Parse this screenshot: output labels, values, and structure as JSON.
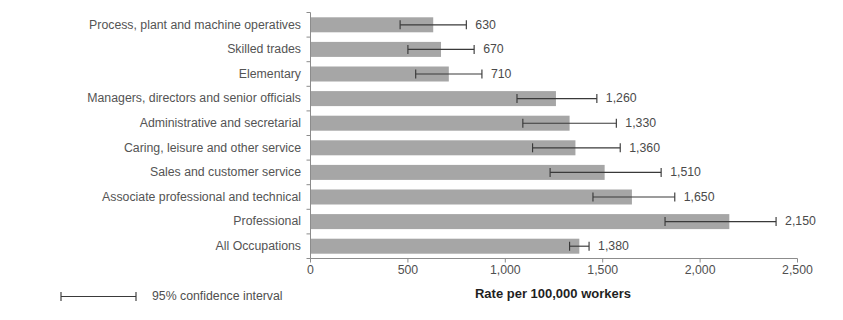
{
  "chart_data": {
    "type": "bar",
    "orientation": "horizontal",
    "title": "",
    "xlabel": "Rate per 100,000 workers",
    "ylabel": "",
    "xlim": [
      0,
      2500
    ],
    "xticks": [
      0,
      500,
      1000,
      1500,
      2000,
      2500
    ],
    "xtick_labels": [
      "0",
      "500",
      "1,000",
      "1,500",
      "2,000",
      "2,500"
    ],
    "grid": false,
    "legend": {
      "position": "bottom-left",
      "entries": [
        {
          "label": "95% confidence interval",
          "marker": "errorbar-capped-line"
        }
      ]
    },
    "categories": [
      "Process, plant and machine operatives",
      "Skilled trades",
      "Elementary",
      "Managers, directors and senior officials",
      "Administrative and secretarial",
      "Caring, leisure and other service",
      "Sales and customer service",
      "Associate professional and technical",
      "Professional",
      "All Occupations"
    ],
    "values": [
      630,
      670,
      710,
      1260,
      1330,
      1360,
      1510,
      1650,
      2150,
      1380
    ],
    "value_labels": [
      "630",
      "670",
      "710",
      "1,260",
      "1,330",
      "1,360",
      "1,510",
      "1,650",
      "2,150",
      "1,380"
    ],
    "ci_low": [
      460,
      500,
      540,
      1060,
      1090,
      1140,
      1230,
      1450,
      1820,
      1330
    ],
    "ci_high": [
      800,
      840,
      880,
      1470,
      1570,
      1590,
      1800,
      1870,
      2390,
      1430
    ],
    "series": [
      {
        "name": "Rate per 100,000 workers",
        "values": [
          630,
          670,
          710,
          1260,
          1330,
          1360,
          1510,
          1650,
          2150,
          1380
        ]
      }
    ],
    "colors": {
      "bar": "#a6a6a6",
      "error_bar": "#3a3a3a",
      "axis": "#8c8c8c",
      "text": "#4f4f4f",
      "background": "#ffffff"
    }
  }
}
